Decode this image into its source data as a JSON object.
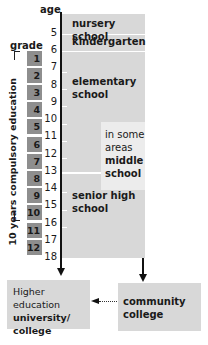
{
  "headers": {
    "age": "age",
    "grade": "grade"
  },
  "ages": [
    "5",
    "6",
    "7",
    "8",
    "9",
    "10",
    "11",
    "12",
    "13",
    "14",
    "15",
    "16",
    "17",
    "18"
  ],
  "grades": [
    "1",
    "2",
    "3",
    "4",
    "5",
    "6",
    "7",
    "8",
    "9",
    "10",
    "11",
    "12"
  ],
  "compulsory_label": "10 years compulsory education",
  "stages": {
    "nursery": "nursery school",
    "kindergarten": "kindergarten",
    "elementary_line1": "elementary",
    "elementary_line2": "school",
    "middle_line1": "in some",
    "middle_line2": "areas",
    "middle_line3": "middle",
    "middle_line4": "school",
    "senior_line1": "senior high",
    "senior_line2": "school"
  },
  "higher_ed": {
    "line1": "Higher education",
    "line2": "university/",
    "line3": "college"
  },
  "community_college": {
    "line1": "community",
    "line2": "college"
  },
  "colors": {
    "stage_fill": "#d8d8d8",
    "middle_fill": "#ececec",
    "grade_fill": "#8e8e8e",
    "axis": "#111111"
  }
}
